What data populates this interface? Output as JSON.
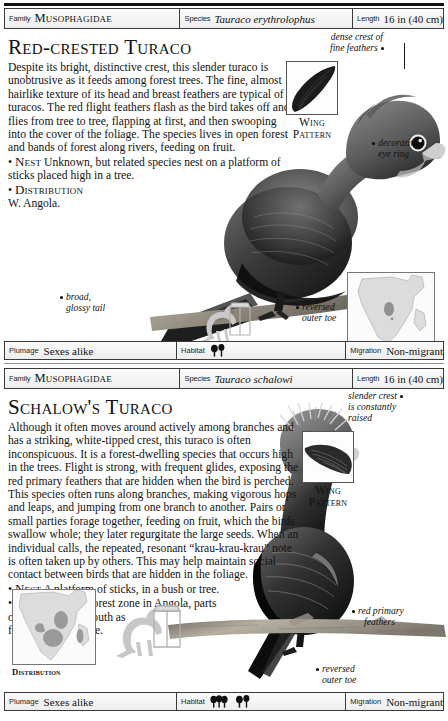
{
  "page": {
    "entries": [
      {
        "id": "red-crested-turaco",
        "header": {
          "family_key": "Family",
          "family_value": "Musophagidae",
          "species_key": "Species",
          "species_value": "Tauraco erythrolophus",
          "length_key": "Length",
          "length_value": "16 in (40 cm)"
        },
        "title": "Red-crested Turaco",
        "prose": "Despite its bright, distinctive crest, this slender turaco is unobtrusive as it feeds among forest trees. The fine, almost hairlike texture of its head and breast feathers are typical of turacos. The red flight feathers flash as the bird takes off and flies from tree to tree, flapping at first, and then swooping into the cover of the foliage. The species lives in open forest and bands of forest along rivers, feeding on fruit.",
        "nest_label": "Nest",
        "nest_text": "Unknown, but related species nest on a platform of sticks placed high in a tree.",
        "distribution_label": "Distribution",
        "distribution_text": "W. Angola.",
        "wing_caption_line1": "Wing",
        "wing_caption_line2": "Pattern",
        "map_caption": "Distribution",
        "annotations": [
          {
            "name": "crest",
            "line1": "dense crest of",
            "line2": "fine feathers"
          },
          {
            "name": "eye-ring",
            "line1": "decorative",
            "line2": "eye ring"
          },
          {
            "name": "tail",
            "line1": "broad,",
            "line2": "glossy tail"
          },
          {
            "name": "outer-toe",
            "line1": "reversed",
            "line2": "outer toe"
          }
        ],
        "footer": {
          "plumage_key": "Plumage",
          "plumage_value": "Sexes alike",
          "habitat_key": "Habitat",
          "habitat_icons": [
            "tree-pair-icon"
          ],
          "migration_key": "Migration",
          "migration_value": "Non-migrant"
        }
      },
      {
        "id": "schalows-turaco",
        "header": {
          "family_key": "Family",
          "family_value": "Musophagidae",
          "species_key": "Species",
          "species_value": "Tauraco schalowi",
          "length_key": "Length",
          "length_value": "16 in (40 cm)"
        },
        "title": "Schalow's Turaco",
        "prose": "Although it often moves around actively among branches and has a striking, white-tipped crest, this turaco is often inconspicuous. It is a forest-dwelling species that occurs high in the trees. Flight is strong, with frequent glides, exposing the red primary feathers that are hidden when the bird is perched. This species often runs along branches, making vigorous hops and leaps, and jumping from one branch to another. Pairs or small parties forage together, feeding on fruit, which the birds swallow whole; they later regurgitate the large seeds. When an individual calls, the repeated, resonant “krau-krau-krau” note is often taken up by others. This may help maintain social contact between birds that are hidden in the foliage.",
        "nest_label": "Nest",
        "nest_text": "A platform of sticks, in a bush or tree.",
        "distribution_label": "Distribution",
        "distribution_text": "Forest zone in Angola, parts",
        "distribution_text_2": "of E. Africa, and south as",
        "distribution_text_3": "far as N. Zimbabwe.",
        "wing_caption_line1": "Wing",
        "wing_caption_line2": "Pattern",
        "map_caption": "Distribution",
        "annotations": [
          {
            "name": "crest",
            "line1": "slender crest",
            "line2": "is constantly",
            "line3": "raised"
          },
          {
            "name": "primaries",
            "line1": "red primary",
            "line2": "feathers"
          },
          {
            "name": "outer-toe",
            "line1": "reversed",
            "line2": "outer toe"
          }
        ],
        "footer": {
          "plumage_key": "Plumage",
          "plumage_value": "Sexes alike",
          "habitat_key": "Habitat",
          "habitat_icons": [
            "forest-icon",
            "tree-pair-icon"
          ],
          "migration_key": "Migration",
          "migration_value": "Non-migrant"
        }
      }
    ],
    "colors": {
      "rule": "#111111",
      "border": "#3a3a3a",
      "map_land": "#d8d8d8",
      "map_range": "#9a9a9a",
      "paper": "#ffffff"
    }
  }
}
